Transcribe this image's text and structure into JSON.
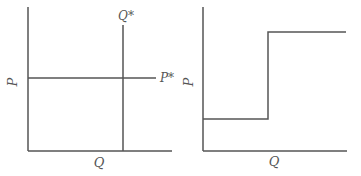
{
  "colors": {
    "line": "#555555",
    "background": "#ffffff"
  },
  "left_panel": {
    "y_axis_label": "P",
    "x_axis_label": "Q",
    "vertical_line_label": "Q*",
    "horizontal_line_label": "P*"
  },
  "right_panel": {
    "y_axis_label": "P",
    "x_axis_label": "Q",
    "curve": "step function: low horizontal segment, vertical jump, high horizontal segment"
  }
}
